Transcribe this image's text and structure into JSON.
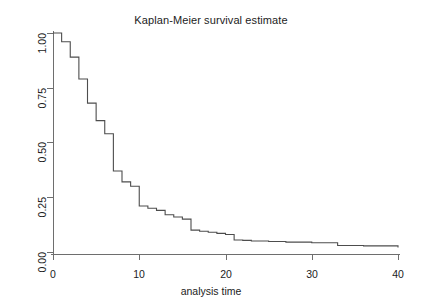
{
  "chart_data": {
    "type": "line",
    "subtype": "step",
    "title": "Kaplan-Meier survival estimate",
    "xlabel": "analysis time",
    "ylabel": "",
    "xlim": [
      0,
      40
    ],
    "ylim": [
      0,
      1
    ],
    "grid": false,
    "legend": null,
    "xticks": [
      0,
      10,
      20,
      30,
      40
    ],
    "xtick_labels": [
      "0",
      "10",
      "20",
      "30",
      "40"
    ],
    "yticks": [
      0,
      0.25,
      0.5,
      0.75,
      1
    ],
    "ytick_labels": [
      "0.00",
      "0.25",
      "0.50",
      "0.75",
      "1.00"
    ],
    "line_color": "#4d4d4d",
    "series": [
      {
        "name": "survival",
        "x": [
          0,
          1,
          2,
          3,
          4,
          5,
          6,
          7,
          8,
          9,
          10,
          11,
          12,
          13,
          14,
          15,
          16,
          17,
          18,
          19,
          20,
          21,
          22,
          23,
          25,
          27,
          30,
          33,
          36,
          40
        ],
        "values": [
          1.0,
          0.96,
          0.89,
          0.79,
          0.68,
          0.6,
          0.54,
          0.37,
          0.32,
          0.3,
          0.21,
          0.2,
          0.19,
          0.17,
          0.16,
          0.15,
          0.1,
          0.095,
          0.09,
          0.085,
          0.08,
          0.055,
          0.053,
          0.05,
          0.048,
          0.045,
          0.042,
          0.03,
          0.028,
          0.025
        ],
        "final_value": 0.02
      }
    ]
  },
  "figure": {
    "title": "Kaplan-Meier survival estimate",
    "xaxis_label": "analysis time",
    "xtick_labels": [
      "0",
      "10",
      "20",
      "30",
      "40"
    ],
    "ytick_labels": [
      "0.00",
      "0.25",
      "0.50",
      "0.75",
      "1.00"
    ]
  }
}
